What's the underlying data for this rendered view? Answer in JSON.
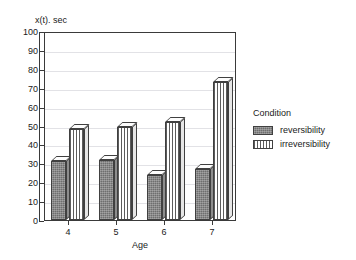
{
  "figure": {
    "cropped_title": "",
    "y_axis_caption": "x(t). sec",
    "x_axis_title": "Age"
  },
  "legend": {
    "title": "Condition",
    "position": "right",
    "entries": [
      {
        "label": "reversibility",
        "pattern": "solid-dark"
      },
      {
        "label": "irreversibility",
        "pattern": "vertical-stripes"
      }
    ]
  },
  "chart_data": {
    "type": "bar",
    "title": "",
    "xlabel": "Age",
    "ylabel": "x(t). sec",
    "categories": [
      "4",
      "5",
      "6",
      "7"
    ],
    "series": [
      {
        "name": "reversibility",
        "values": [
          31,
          32,
          24,
          27
        ],
        "color": "#6e6e6e"
      },
      {
        "name": "irreversibility",
        "values": [
          48,
          49,
          52,
          73
        ],
        "color": "#ffffff"
      }
    ],
    "ylim": [
      0,
      100
    ],
    "yticks": [
      0,
      10,
      20,
      30,
      40,
      50,
      60,
      70,
      80,
      90,
      100
    ],
    "ytick_labels": [
      "0",
      "10",
      "20",
      "30",
      "40",
      "50",
      "60",
      "70",
      "80",
      "90",
      "100"
    ],
    "grid": true,
    "legend_position": "right",
    "style": "3d-bars"
  }
}
